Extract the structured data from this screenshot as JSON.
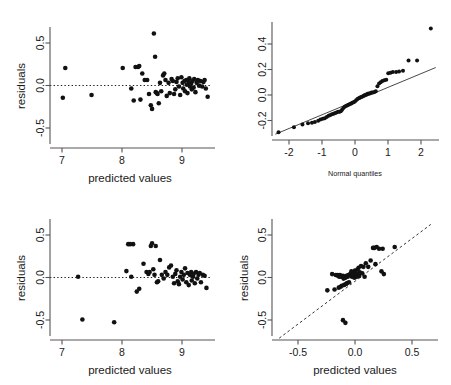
{
  "figure": {
    "kind": "regression-diagnostics-2x2",
    "background": "#ffffff",
    "point_color": "#111111",
    "line_color": "#333333"
  },
  "chart_data": [
    {
      "id": "residuals-vs-predicted-top",
      "type": "scatter",
      "title": "",
      "xlabel": "predicted values",
      "ylabel": "residuals",
      "xlim": [
        6.85,
        9.55
      ],
      "ylim": [
        -0.68,
        0.62
      ],
      "xticks": [
        7,
        8,
        9
      ],
      "xtick_labels": [
        "7",
        "8",
        "9"
      ],
      "yticks": [
        -0.5,
        0.0,
        0.5
      ],
      "ytick_labels": [
        "-0.5",
        "0.0",
        "0.5"
      ],
      "grid": false,
      "legend": "none",
      "reference_lines": [
        {
          "kind": "horizontal",
          "y": 0.0,
          "style": "dotted"
        }
      ],
      "x": [
        7.06,
        7.1,
        7.53,
        8.04,
        8.18,
        8.22,
        8.25,
        8.29,
        8.31,
        8.33,
        8.36,
        8.4,
        8.44,
        8.47,
        8.5,
        8.52,
        8.55,
        8.57,
        8.58,
        8.6,
        8.61,
        8.63,
        8.65,
        8.67,
        8.7,
        8.72,
        8.74,
        8.76,
        8.79,
        8.81,
        8.84,
        8.86,
        8.88,
        8.9,
        8.92,
        8.94,
        8.96,
        8.98,
        9.0,
        9.02,
        9.03,
        9.05,
        9.06,
        9.08,
        9.09,
        9.1,
        9.12,
        9.13,
        9.14,
        9.16,
        9.17,
        9.18,
        9.2,
        9.21,
        9.23,
        9.25,
        9.27,
        9.29,
        9.31,
        9.34,
        9.36,
        9.38,
        9.4,
        9.43
      ],
      "y": [
        -0.14,
        0.18,
        -0.11,
        0.18,
        -0.04,
        -0.17,
        0.19,
        0.19,
        0.2,
        -0.16,
        0.12,
        0.05,
        0.05,
        -0.1,
        -0.22,
        -0.26,
        0.55,
        0.3,
        -0.08,
        -0.09,
        -0.1,
        -0.2,
        0.02,
        -0.07,
        0.1,
        0.12,
        0.05,
        -0.12,
        0.02,
        -0.09,
        0.06,
        0.04,
        -0.1,
        -0.05,
        0.03,
        0.07,
        -0.02,
        -0.11,
        0.08,
        0.02,
        -0.04,
        0.04,
        -0.07,
        0.05,
        0.0,
        -0.09,
        0.03,
        0.07,
        -0.02,
        0.01,
        -0.05,
        0.04,
        -0.03,
        0.06,
        -0.08,
        0.02,
        0.05,
        -0.01,
        0.04,
        -0.02,
        0.03,
        0.05,
        -0.04,
        -0.13
      ]
    },
    {
      "id": "normal-qq",
      "type": "scatter",
      "title": "",
      "xlabel": "Normal quantiles",
      "ylabel": "",
      "xlim": [
        -2.55,
        2.55
      ],
      "ylim": [
        -0.32,
        0.6
      ],
      "xticks": [
        -2,
        -1,
        0,
        1,
        2
      ],
      "xtick_labels": [
        "-2",
        "-1",
        "0",
        "1",
        "2"
      ],
      "yticks": [
        -0.2,
        0.0,
        0.2,
        0.4
      ],
      "ytick_labels": [
        "-0.2",
        "0.0",
        "0.2",
        "0.4"
      ],
      "grid": false,
      "legend": "none",
      "reference_lines": [
        {
          "kind": "qq-line",
          "style": "solid",
          "x0": -2.45,
          "y0": -0.275,
          "x1": 2.45,
          "y1": 0.245
        }
      ],
      "x": [
        -2.35,
        -1.88,
        -1.62,
        -1.45,
        -1.33,
        -1.24,
        -1.14,
        -1.07,
        -1.0,
        -0.94,
        -0.88,
        -0.82,
        -0.77,
        -0.72,
        -0.67,
        -0.62,
        -0.58,
        -0.53,
        -0.49,
        -0.45,
        -0.41,
        -0.37,
        -0.33,
        -0.29,
        -0.25,
        -0.21,
        -0.17,
        -0.13,
        -0.1,
        -0.06,
        -0.02,
        0.02,
        0.06,
        0.1,
        0.13,
        0.17,
        0.21,
        0.25,
        0.29,
        0.33,
        0.37,
        0.41,
        0.45,
        0.49,
        0.53,
        0.58,
        0.62,
        0.67,
        0.72,
        0.77,
        0.82,
        0.88,
        0.94,
        1.0,
        1.07,
        1.14,
        1.24,
        1.33,
        1.45,
        1.62,
        1.88,
        2.3
      ],
      "y": [
        -0.26,
        -0.22,
        -0.2,
        -0.19,
        -0.185,
        -0.18,
        -0.17,
        -0.16,
        -0.155,
        -0.15,
        -0.14,
        -0.13,
        -0.125,
        -0.12,
        -0.115,
        -0.11,
        -0.105,
        -0.1,
        -0.1,
        -0.095,
        -0.085,
        -0.07,
        -0.06,
        -0.055,
        -0.05,
        -0.045,
        -0.04,
        -0.035,
        -0.03,
        -0.025,
        -0.02,
        -0.01,
        0.0,
        0.005,
        0.01,
        0.015,
        0.02,
        0.025,
        0.03,
        0.035,
        0.04,
        0.042,
        0.045,
        0.05,
        0.05,
        0.055,
        0.06,
        0.1,
        0.12,
        0.13,
        0.14,
        0.145,
        0.15,
        0.2,
        0.205,
        0.21,
        0.21,
        0.215,
        0.22,
        0.3,
        0.3,
        0.55
      ]
    },
    {
      "id": "residuals-vs-predicted-bottom",
      "type": "scatter",
      "title": "",
      "xlabel": "predicted values",
      "ylabel": "residuals",
      "xlim": [
        6.85,
        9.55
      ],
      "ylim": [
        -0.68,
        0.62
      ],
      "xticks": [
        7,
        8,
        9
      ],
      "xtick_labels": [
        "7",
        "8",
        "9"
      ],
      "yticks": [
        -0.5,
        0.0,
        0.5
      ],
      "ytick_labels": [
        "-0.5",
        "0.0",
        "0.5"
      ],
      "grid": false,
      "legend": "none",
      "reference_lines": [
        {
          "kind": "horizontal",
          "y": 0.0,
          "style": "dotted"
        }
      ],
      "x": [
        7.31,
        7.38,
        7.9,
        8.1,
        8.13,
        8.16,
        8.18,
        8.21,
        8.27,
        8.31,
        8.38,
        8.43,
        8.46,
        8.48,
        8.5,
        8.52,
        8.54,
        8.56,
        8.58,
        8.6,
        8.62,
        8.65,
        8.68,
        8.71,
        8.74,
        8.77,
        8.8,
        8.83,
        8.86,
        8.88,
        8.9,
        8.92,
        8.94,
        8.96,
        8.98,
        9.0,
        9.02,
        9.04,
        9.06,
        9.08,
        9.1,
        9.12,
        9.14,
        9.16,
        9.17,
        9.19,
        9.2,
        9.22,
        9.24,
        9.26,
        9.28,
        9.3,
        9.32,
        9.35,
        9.38,
        9.41
      ],
      "y": [
        0.0,
        -0.46,
        -0.49,
        0.06,
        0.35,
        0.35,
        0.0,
        0.35,
        -0.16,
        -0.13,
        0.14,
        0.05,
        0.03,
        0.05,
        0.33,
        0.36,
        0.08,
        0.02,
        0.33,
        -0.06,
        -0.05,
        0.18,
        0.02,
        -0.02,
        0.05,
        0.02,
        0.1,
        0.12,
        0.0,
        -0.07,
        0.03,
        0.07,
        -0.05,
        -0.08,
        0.0,
        0.05,
        -0.03,
        0.02,
        0.09,
        -0.06,
        0.04,
        -0.09,
        0.02,
        0.05,
        -0.04,
        0.0,
        0.03,
        -0.07,
        0.05,
        -0.02,
        0.02,
        0.04,
        -0.06,
        0.02,
        0.01,
        -0.12
      ]
    },
    {
      "id": "residuals-vs-predicted-scaled",
      "type": "scatter",
      "title": "",
      "xlabel": "predicted values",
      "ylabel": "residuals",
      "xlim": [
        -0.72,
        0.66
      ],
      "ylim": [
        -0.68,
        0.66
      ],
      "xticks": [
        -0.5,
        0.0,
        0.5
      ],
      "xtick_labels": [
        "-0.5",
        "0.0",
        "0.5"
      ],
      "yticks": [
        -0.5,
        0.0,
        0.5
      ],
      "ytick_labels": [
        "-0.5",
        "0.0",
        "0.5"
      ],
      "grid": false,
      "legend": "none",
      "reference_lines": [
        {
          "kind": "identity",
          "style": "dashed",
          "x0": -0.66,
          "y0": -0.66,
          "x1": 0.6,
          "y1": 0.6
        }
      ],
      "x": [
        -0.26,
        -0.22,
        -0.2,
        -0.19,
        -0.175,
        -0.17,
        -0.165,
        -0.16,
        -0.155,
        -0.15,
        -0.145,
        -0.14,
        -0.13,
        -0.125,
        -0.12,
        -0.115,
        -0.11,
        -0.105,
        -0.1,
        -0.095,
        -0.09,
        -0.085,
        -0.08,
        -0.07,
        -0.06,
        -0.055,
        -0.05,
        -0.045,
        -0.04,
        -0.035,
        -0.03,
        -0.025,
        -0.02,
        -0.015,
        -0.01,
        -0.005,
        0.0,
        0.005,
        0.01,
        0.02,
        0.03,
        0.04,
        0.05,
        0.06,
        0.08,
        0.1,
        0.12,
        0.13,
        0.14,
        0.15,
        0.17,
        0.19,
        0.2,
        0.21,
        0.3,
        -0.13,
        -0.11
      ],
      "y": [
        -0.13,
        0.05,
        -0.12,
        0.04,
        0.04,
        0.03,
        -0.1,
        0.02,
        0.04,
        -0.09,
        0.02,
        -0.08,
        0.03,
        0.0,
        -0.07,
        0.02,
        0.01,
        -0.06,
        0.03,
        -0.05,
        0.02,
        0.04,
        -0.04,
        0.05,
        0.08,
        0.02,
        0.07,
        0.03,
        0.05,
        0.01,
        0.09,
        0.04,
        0.06,
        0.02,
        0.1,
        0.05,
        0.12,
        0.03,
        0.07,
        0.14,
        0.06,
        0.13,
        0.02,
        0.17,
        0.13,
        0.2,
        0.34,
        0.34,
        0.16,
        0.35,
        0.33,
        0.08,
        0.33,
        0.05,
        0.35,
        -0.46,
        -0.49
      ]
    }
  ]
}
